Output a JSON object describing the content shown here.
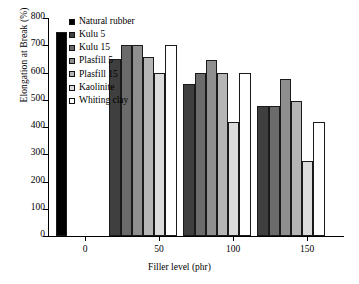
{
  "chart_data": {
    "type": "bar",
    "title": "",
    "xlabel": "Filler level (phr)",
    "ylabel": "Elongation at Break (%)",
    "categories": [
      "0",
      "50",
      "100",
      "150"
    ],
    "ylim": [
      0,
      800
    ],
    "yticks": [
      0,
      100,
      200,
      300,
      400,
      500,
      600,
      700,
      800
    ],
    "xticks": [
      "0",
      "50",
      "100",
      "150"
    ],
    "grid": false,
    "legend_position": "top-left-inside",
    "series": [
      {
        "name": "Natural rubber",
        "color": "#000000",
        "values": [
          750,
          null,
          null,
          null
        ]
      },
      {
        "name": "Kulu 5",
        "color": "#3f3f3f",
        "values": [
          null,
          648,
          557,
          478
        ]
      },
      {
        "name": "Kulu 15",
        "color": "#6b6b6b",
        "values": [
          null,
          700,
          598,
          477
        ]
      },
      {
        "name": "Plasfill 5",
        "color": "#8f8f8f",
        "values": [
          null,
          700,
          645,
          576
        ]
      },
      {
        "name": "Plasfill 15",
        "color": "#b5b5b5",
        "values": [
          null,
          657,
          598,
          497
        ]
      },
      {
        "name": "Kaolinite",
        "color": "#dcdcdc",
        "values": [
          null,
          598,
          419,
          277
        ]
      },
      {
        "name": "Whiting clay",
        "color": "#ffffff",
        "values": [
          null,
          700,
          598,
          418
        ]
      }
    ]
  },
  "legend": {
    "items": [
      {
        "label": "Natural rubber"
      },
      {
        "label": "Kulu 5"
      },
      {
        "label": "Kulu 15"
      },
      {
        "label": "Plasfill 5"
      },
      {
        "label": "Plasfill 15"
      },
      {
        "label": "Kaolinite"
      },
      {
        "label": "Whiting clay"
      }
    ]
  },
  "axes": {
    "y_title": "Elongation at Break (%)",
    "x_title": "Filler level (phr)",
    "y_tick_labels": [
      "800",
      "700",
      "600",
      "500",
      "400",
      "300",
      "200",
      "100",
      "0"
    ],
    "x_tick_labels": [
      "0",
      "50",
      "100",
      "150"
    ]
  }
}
